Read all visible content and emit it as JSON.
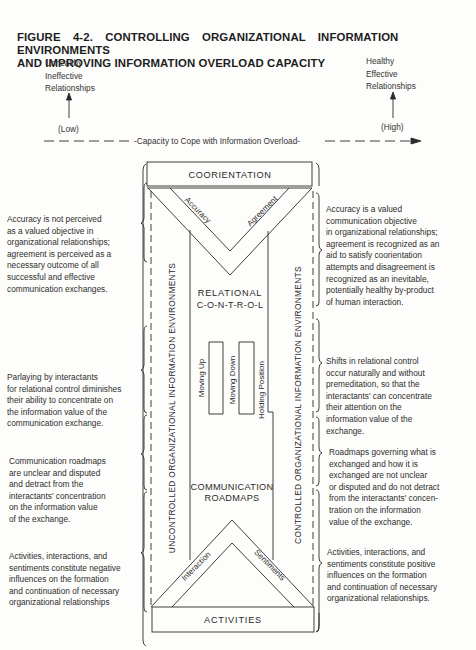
{
  "figure": {
    "title_line1": "FIGURE 4-2. CONTROLLING ORGANIZATIONAL INFORMATION ENVIRONMENTS",
    "title_line2": "AND IMPROVING INFORMATION OVERLOAD CAPACITY"
  },
  "scale": {
    "left_pole": [
      "Unhealthy",
      "Ineffective",
      "Relationships"
    ],
    "right_pole": [
      "Healthy",
      "Effective",
      "Relationships"
    ],
    "low_label": "(Low)",
    "high_label": "(High)",
    "axis_label": "-Capacity to Cope with Information Overload-"
  },
  "diagram": {
    "top_box": "COORIENTATION",
    "v_left_arm": "Accuracy",
    "v_right_arm": "Agreement",
    "relational_line1": "RELATIONAL",
    "relational_line2": "C-O-N-T-R-O-L",
    "prong1": "Moving Up",
    "prong2": "Moving Down",
    "prong3": "Holding Position",
    "roadmaps_line1": "COMMUNICATION",
    "roadmaps_line2": "ROADMAPS",
    "tri_left_arm": "Interaction",
    "tri_right_arm": "Sentiments",
    "bottom_box": "ACTIVITIES",
    "left_vertical": "UNCONTROLLED ORGANIZATIONAL INFORMATION ENVIRONMENTS",
    "right_vertical": "CONTROLLED ORGANIZATIONAL INFORMATION ENVIRONMENTS"
  },
  "left_notes": [
    [
      "Accuracy is not perceived",
      "as a valued objective in",
      "organizational relationships;",
      "agreement is perceived as a",
      "necessary outcome of all",
      "successful and effective",
      "communication exchanges."
    ],
    [
      "Parlaying by interactants",
      "for relational control diminishes",
      "their ability to concentrate on",
      "the information value of the",
      "communication exchange."
    ],
    [
      "Communication roadmaps",
      "are unclear and disputed",
      "and detract from the",
      "interactants' concentration",
      "on the information value",
      "of the exchange."
    ],
    [
      "Activities, interactions, and",
      "sentiments constitute negative",
      "influences on the formation",
      "and continuation of necessary",
      "organizational relationships"
    ]
  ],
  "right_notes": [
    [
      "Accuracy is a valued",
      "communication objective",
      "in organizational relationships;",
      "agreement is recognized as an",
      "aid to satisfy coorientation",
      "attempts and disagreement is",
      "recognized as an inevitable,",
      "potentially healthy by-product",
      "of human interaction."
    ],
    [
      "Shifts in relational control",
      "occur naturally and without",
      "premeditation, so that the",
      "interactants' can concentrate",
      "their attention on the",
      "information value of the",
      "exchange."
    ],
    [
      "Roadmaps governing what is",
      "exchanged and how it is",
      "exchanged are not unclear",
      "or disputed and do not detract",
      "from the interactants' concen-",
      "tration on the information",
      "value of the exchange."
    ],
    [
      "Activities, interactions, and",
      "sentiments constitute positive",
      "influences on the formation",
      "and continuation of necessary",
      "organizational relationships."
    ]
  ]
}
